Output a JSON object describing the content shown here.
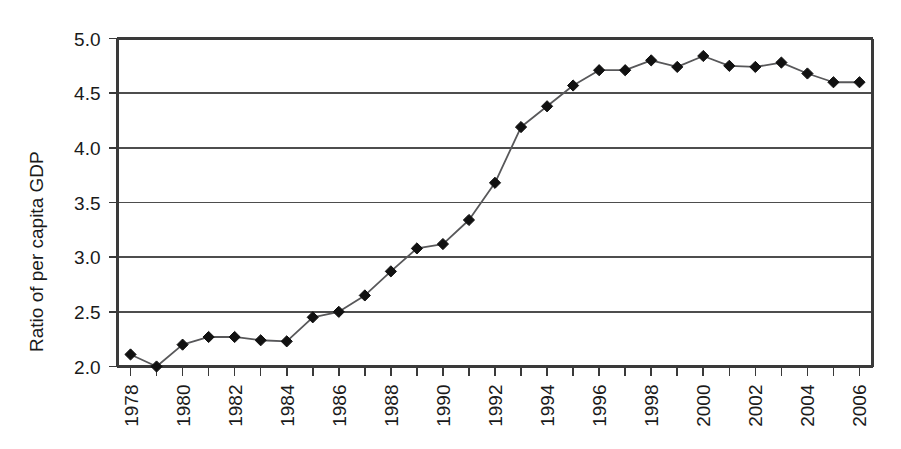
{
  "chart_data": {
    "type": "line",
    "title": "",
    "subtitle": "",
    "xlabel": "",
    "ylabel": "Ratio of per capita GDP",
    "xlim": [
      1977.5,
      2006.5
    ],
    "ylim": [
      2.0,
      5.0
    ],
    "grid": true,
    "legend": false,
    "legend_position": "none",
    "x_tick_step": 2,
    "x_tick_rotation_deg": -90,
    "marker": "diamond",
    "line_color": "#58585a",
    "marker_color": "#111111",
    "y_ticks": [
      "2.0",
      "2.5",
      "3.0",
      "3.5",
      "4.0",
      "4.5",
      "5.0"
    ],
    "y_tick_values": [
      2.0,
      2.5,
      3.0,
      3.5,
      4.0,
      4.5,
      5.0
    ],
    "x_tick_labels": [
      "1978",
      "1980",
      "1982",
      "1984",
      "1986",
      "1988",
      "1990",
      "1992",
      "1994",
      "1996",
      "1998",
      "2000",
      "2002",
      "2004",
      "2006"
    ],
    "x": [
      1978,
      1979,
      1980,
      1981,
      1982,
      1983,
      1984,
      1985,
      1986,
      1987,
      1988,
      1989,
      1990,
      1991,
      1992,
      1993,
      1994,
      1995,
      1996,
      1997,
      1998,
      1999,
      2000,
      2001,
      2002,
      2003,
      2004,
      2005,
      2006
    ],
    "values": [
      2.11,
      2.0,
      2.2,
      2.27,
      2.27,
      2.24,
      2.23,
      2.45,
      2.5,
      2.65,
      2.87,
      3.08,
      3.12,
      3.34,
      3.68,
      4.19,
      4.38,
      4.57,
      4.71,
      4.71,
      4.8,
      4.74,
      4.84,
      4.75,
      4.74,
      4.78,
      4.68,
      4.6,
      4.6
    ],
    "series": [
      {
        "name": "Ratio of per capita GDP",
        "values": [
          2.11,
          2.0,
          2.2,
          2.27,
          2.27,
          2.24,
          2.23,
          2.45,
          2.5,
          2.65,
          2.87,
          3.08,
          3.12,
          3.34,
          3.68,
          4.19,
          4.38,
          4.57,
          4.71,
          4.71,
          4.8,
          4.74,
          4.84,
          4.75,
          4.74,
          4.78,
          4.68,
          4.6,
          4.6
        ]
      }
    ]
  }
}
